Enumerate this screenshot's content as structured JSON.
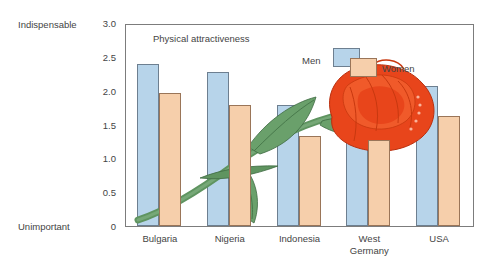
{
  "chart_data": {
    "type": "bar",
    "title": "Physical attractiveness",
    "xlabel": "",
    "ylabel": "",
    "ylim": [
      0,
      3.0
    ],
    "yticks": [
      "0",
      "0.5",
      "1.0",
      "1.5",
      "2.0",
      "2.5",
      "3.0"
    ],
    "ytick_values": [
      0,
      0.5,
      1.0,
      1.5,
      2.0,
      2.5,
      3.0
    ],
    "axis_end_labels": {
      "top": "Indispensable",
      "bottom": "Unimportant"
    },
    "grid": false,
    "legend_position": "top-right-inside",
    "categories": [
      "Bulgaria",
      "Nigeria",
      "Indonesia",
      "West\nGermany",
      "USA"
    ],
    "series": [
      {
        "name": "Men",
        "color": "#b7d4ea",
        "values": [
          2.4,
          2.27,
          1.79,
          1.87,
          2.07
        ]
      },
      {
        "name": "Women",
        "color": "#f6cfab",
        "values": [
          1.96,
          1.79,
          1.33,
          1.27,
          1.62
        ]
      }
    ],
    "annotations": [
      "decorative rose illustration overlaying the plot"
    ]
  },
  "colors": {
    "men_fill": "#b7d4ea",
    "men_stroke": "#6d7f90",
    "women_fill": "#f6cfab",
    "women_stroke": "#9a7558",
    "frame": "#7c7c7c",
    "text": "#444444",
    "rose_petal": "#e8451b",
    "rose_petal_dark": "#c32f10",
    "leaf": "#5f9460",
    "leaf_dark": "#48794b"
  }
}
